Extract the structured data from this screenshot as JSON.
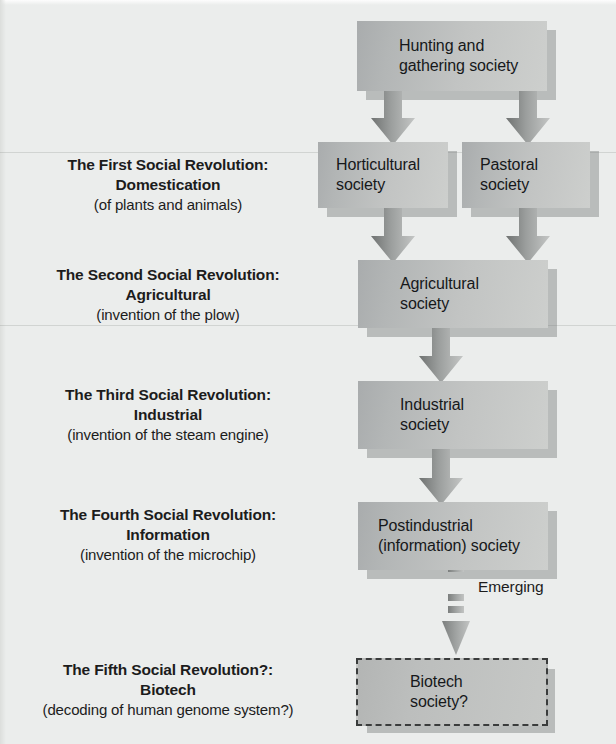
{
  "figure": {
    "background_color": "#ebedec",
    "box_fill_color": "#c2c4c3",
    "arrow_color": "#8b8e8d",
    "text_color": "#1c1c1c"
  },
  "revolutions": [
    {
      "line1": "The First Social Revolution:",
      "line2": "Domestication",
      "line3": "(of plants and animals)"
    },
    {
      "line1": "The Second Social Revolution:",
      "line2": "Agricultural",
      "line3": "(invention of the plow)"
    },
    {
      "line1": "The Third Social Revolution:",
      "line2": "Industrial",
      "line3": "(invention of the steam engine)"
    },
    {
      "line1": "The Fourth Social Revolution:",
      "line2": "Information",
      "line3": "(invention of the microchip)"
    },
    {
      "line1": "The Fifth Social Revolution?:",
      "line2": "Biotech",
      "line3": "(decoding of human genome system?)"
    }
  ],
  "nodes": {
    "hunting": {
      "line1": "Hunting and",
      "line2": "gathering society"
    },
    "horticultural": {
      "line1": "Horticultural",
      "line2": "society"
    },
    "pastoral": {
      "line1": "Pastoral",
      "line2": "society"
    },
    "agricultural": {
      "line1": "Agricultural",
      "line2": "society"
    },
    "industrial": {
      "line1": "Industrial",
      "line2": "society"
    },
    "postindustrial": {
      "line1": "Postindustrial",
      "line2": "(information) society"
    },
    "biotech": {
      "line1": "Biotech",
      "line2": "society?"
    }
  },
  "connectors": {
    "emerging_label": "Emerging"
  }
}
